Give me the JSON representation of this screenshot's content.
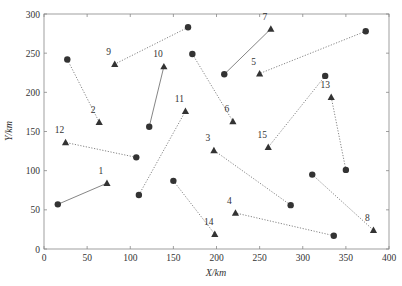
{
  "chart_data": {
    "type": "scatter",
    "title": "",
    "xlabel": "X/km",
    "ylabel": "Y/km",
    "xlim": [
      0,
      400
    ],
    "ylim": [
      0,
      300
    ],
    "xticks": [
      0,
      50,
      100,
      150,
      200,
      250,
      300,
      350,
      400
    ],
    "yticks": [
      0,
      50,
      100,
      150,
      200,
      250,
      300
    ],
    "grid": false,
    "legend": null,
    "marker_types": {
      "circle": "origin point",
      "triangle": "destination point"
    },
    "pairs": [
      {
        "id": "1",
        "circle": [
          16,
          57
        ],
        "triangle": [
          73,
          84
        ],
        "line": "solid"
      },
      {
        "id": "2",
        "circle": [
          27,
          242
        ],
        "triangle": [
          64,
          162
        ],
        "line": "dotted"
      },
      {
        "id": "3",
        "circle": [
          286,
          56
        ],
        "triangle": [
          197,
          126
        ],
        "line": "dotted"
      },
      {
        "id": "4",
        "circle": [
          336,
          17
        ],
        "triangle": [
          222,
          46
        ],
        "line": "dotted"
      },
      {
        "id": "5",
        "circle": [
          373,
          278
        ],
        "triangle": [
          250,
          224
        ],
        "line": "dotted"
      },
      {
        "id": "6",
        "circle": [
          172,
          249
        ],
        "triangle": [
          219,
          163
        ],
        "line": "dotted"
      },
      {
        "id": "7",
        "circle": [
          209,
          223
        ],
        "triangle": [
          263,
          281
        ],
        "line": "solid"
      },
      {
        "id": "8",
        "circle": [
          311,
          95
        ],
        "triangle": [
          382,
          24
        ],
        "line": "dotted"
      },
      {
        "id": "9",
        "circle": [
          167,
          283
        ],
        "triangle": [
          82,
          236
        ],
        "line": "dotted"
      },
      {
        "id": "10",
        "circle": [
          122,
          156
        ],
        "triangle": [
          139,
          233
        ],
        "line": "solid"
      },
      {
        "id": "11",
        "circle": [
          110,
          69
        ],
        "triangle": [
          164,
          176
        ],
        "line": "dotted"
      },
      {
        "id": "12",
        "circle": [
          107,
          117
        ],
        "triangle": [
          25,
          136
        ],
        "line": "dotted"
      },
      {
        "id": "13",
        "circle": [
          350,
          101
        ],
        "triangle": [
          333,
          194
        ],
        "line": "dotted"
      },
      {
        "id": "14",
        "circle": [
          150,
          87
        ],
        "triangle": [
          198,
          19
        ],
        "line": "dotted"
      },
      {
        "id": "15",
        "circle": [
          326,
          221
        ],
        "triangle": [
          260,
          130
        ],
        "line": "dotted"
      }
    ]
  },
  "axes": {
    "x_title": "X/km",
    "y_title": "Y/km"
  }
}
